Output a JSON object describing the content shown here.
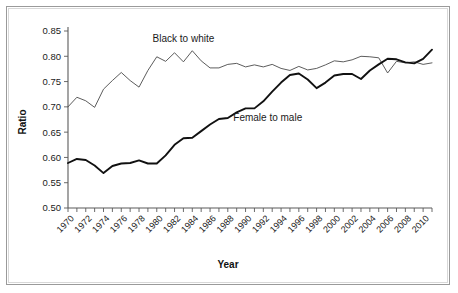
{
  "chart_data": {
    "type": "line",
    "title": "",
    "xlabel": "Year",
    "ylabel": "Ratio",
    "ylim": [
      0.5,
      0.85
    ],
    "xlim": [
      1970,
      2011
    ],
    "grid": false,
    "legend_position": "inline-annotations",
    "y_ticks": [
      "0.50",
      "0.55",
      "0.60",
      "0.65",
      "0.70",
      "0.75",
      "0.80",
      "0.85"
    ],
    "y_tick_values": [
      0.5,
      0.55,
      0.6,
      0.65,
      0.7,
      0.75,
      0.8,
      0.85
    ],
    "x_ticks": [
      "1970",
      "1972",
      "1974",
      "1976",
      "1978",
      "1980",
      "1982",
      "1984",
      "1986",
      "1988",
      "1990",
      "1992",
      "1994",
      "1996",
      "1998",
      "2000",
      "2002",
      "2004",
      "2006",
      "2008",
      "2010"
    ],
    "x_tick_values": [
      1970,
      1972,
      1974,
      1976,
      1978,
      1980,
      1982,
      1984,
      1986,
      1988,
      1990,
      1992,
      1994,
      1996,
      1998,
      2000,
      2002,
      2004,
      2006,
      2008,
      2010
    ],
    "x_minor_ticks_every": 1,
    "annotations": [
      {
        "text": "Black to white",
        "x": 1983,
        "y": 0.828
      },
      {
        "text": "Female to male",
        "x": 1992.5,
        "y": 0.672
      }
    ],
    "x": [
      1970,
      1971,
      1972,
      1973,
      1974,
      1975,
      1976,
      1977,
      1978,
      1979,
      1980,
      1981,
      1982,
      1983,
      1984,
      1985,
      1986,
      1987,
      1988,
      1989,
      1990,
      1991,
      1992,
      1993,
      1994,
      1995,
      1996,
      1997,
      1998,
      1999,
      2000,
      2001,
      2002,
      2003,
      2004,
      2005,
      2006,
      2007,
      2008,
      2009,
      2010,
      2011
    ],
    "series": [
      {
        "name": "Black to white",
        "color": "#4a4a4a",
        "linewidth": 0.9,
        "values": [
          0.7,
          0.719,
          0.712,
          0.699,
          0.735,
          0.752,
          0.768,
          0.752,
          0.739,
          0.772,
          0.799,
          0.79,
          0.807,
          0.789,
          0.811,
          0.791,
          0.777,
          0.777,
          0.784,
          0.786,
          0.779,
          0.783,
          0.779,
          0.784,
          0.776,
          0.772,
          0.78,
          0.773,
          0.776,
          0.783,
          0.791,
          0.789,
          0.793,
          0.8,
          0.799,
          0.797,
          0.767,
          0.79,
          0.787,
          0.789,
          0.784,
          0.787
        ]
      },
      {
        "name": "Female to male",
        "color": "#111111",
        "linewidth": 1.9,
        "values": [
          0.589,
          0.597,
          0.595,
          0.584,
          0.569,
          0.583,
          0.588,
          0.589,
          0.594,
          0.588,
          0.588,
          0.604,
          0.625,
          0.638,
          0.639,
          0.652,
          0.665,
          0.676,
          0.678,
          0.689,
          0.697,
          0.697,
          0.711,
          0.73,
          0.748,
          0.763,
          0.766,
          0.754,
          0.737,
          0.748,
          0.762,
          0.765,
          0.765,
          0.755,
          0.772,
          0.784,
          0.795,
          0.794,
          0.788,
          0.786,
          0.795,
          0.813
        ]
      }
    ]
  }
}
